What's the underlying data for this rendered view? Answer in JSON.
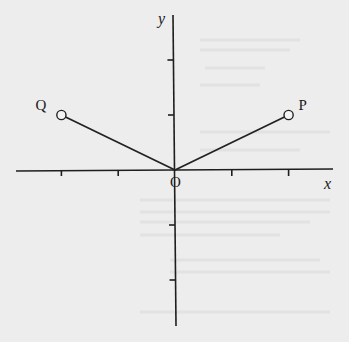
{
  "diagram": {
    "type": "coordinate-plane",
    "axes": {
      "x_label": "x",
      "y_label": "y",
      "origin_label": "O",
      "x_ticks": [
        -2,
        -1,
        1,
        2
      ],
      "y_ticks": [
        2,
        1,
        -1,
        -2
      ],
      "x_range": [
        -2.6,
        2.8
      ],
      "y_range": [
        -2.8,
        2.8
      ]
    },
    "points": [
      {
        "id": "Q",
        "label": "Q",
        "x": -2,
        "y": 1,
        "marker": "open-circle"
      },
      {
        "id": "P",
        "label": "P",
        "x": 2,
        "y": 1,
        "marker": "open-circle"
      }
    ],
    "segments": [
      {
        "from": "O",
        "to": "Q"
      },
      {
        "from": "O",
        "to": "P"
      }
    ],
    "colors": {
      "background": "#ededed",
      "ink": "#1e1e1e"
    }
  }
}
